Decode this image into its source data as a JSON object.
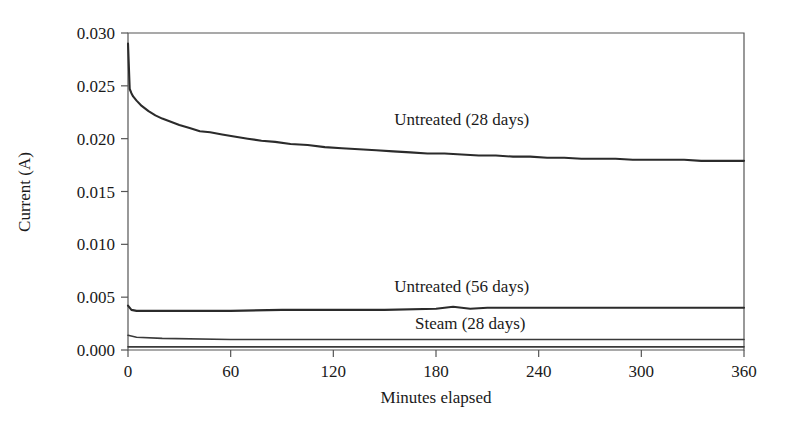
{
  "chart_data": {
    "type": "line",
    "title": "",
    "xlabel": "Minutes elapsed",
    "ylabel": "Current (A)",
    "xlim": [
      0,
      360
    ],
    "ylim": [
      0.0,
      0.03
    ],
    "xticks": [
      0,
      60,
      120,
      180,
      240,
      300,
      360
    ],
    "xtick_labels": [
      "0",
      "60",
      "120",
      "180",
      "240",
      "300",
      "360"
    ],
    "yticks": [
      0.0,
      0.005,
      0.01,
      0.015,
      0.02,
      0.025,
      0.03
    ],
    "ytick_labels": [
      "0.000",
      "0.005",
      "0.010",
      "0.015",
      "0.020",
      "0.025",
      "0.030"
    ],
    "grid": false,
    "legend": "inline-annotations",
    "series": [
      {
        "name": "Untreated (28 days)",
        "annotation": "Untreated (28 days)",
        "annotation_x": 195,
        "annotation_y": 0.0213,
        "color": "#2b2b2b",
        "x": [
          0,
          1,
          2,
          3,
          5,
          8,
          12,
          16,
          20,
          25,
          30,
          36,
          42,
          48,
          55,
          62,
          70,
          78,
          86,
          95,
          105,
          115,
          125,
          135,
          145,
          155,
          165,
          175,
          185,
          195,
          205,
          215,
          225,
          235,
          245,
          255,
          265,
          275,
          285,
          295,
          305,
          315,
          325,
          335,
          345,
          355,
          360
        ],
        "y": [
          0.029,
          0.0247,
          0.0243,
          0.024,
          0.0236,
          0.0231,
          0.0226,
          0.0222,
          0.0219,
          0.0216,
          0.0213,
          0.021,
          0.0207,
          0.0206,
          0.0204,
          0.0202,
          0.02,
          0.0198,
          0.0197,
          0.0195,
          0.0194,
          0.0192,
          0.0191,
          0.019,
          0.0189,
          0.0188,
          0.0187,
          0.0186,
          0.0186,
          0.0185,
          0.0184,
          0.0184,
          0.0183,
          0.0183,
          0.0182,
          0.0182,
          0.0181,
          0.0181,
          0.0181,
          0.018,
          0.018,
          0.018,
          0.018,
          0.0179,
          0.0179,
          0.0179,
          0.0179
        ]
      },
      {
        "name": "Untreated (56 days)",
        "annotation": "Untreated (56 days)",
        "annotation_x": 195,
        "annotation_y": 0.0055,
        "color": "#2b2b2b",
        "x": [
          0,
          2,
          5,
          10,
          20,
          40,
          60,
          90,
          120,
          150,
          180,
          190,
          200,
          210,
          220,
          240,
          270,
          300,
          330,
          360
        ],
        "y": [
          0.0042,
          0.0038,
          0.0037,
          0.0037,
          0.0037,
          0.0037,
          0.0037,
          0.0038,
          0.0038,
          0.0038,
          0.0039,
          0.0041,
          0.0039,
          0.004,
          0.004,
          0.004,
          0.004,
          0.004,
          0.004,
          0.004
        ]
      },
      {
        "name": "Steam (28 days)",
        "annotation": "Steam (28 days)",
        "annotation_x": 200,
        "annotation_y": 0.002,
        "color": "#3a3a3a",
        "x": [
          0,
          5,
          20,
          60,
          120,
          180,
          240,
          300,
          360
        ],
        "y": [
          0.0014,
          0.0012,
          0.0011,
          0.001,
          0.001,
          0.001,
          0.001,
          0.001,
          0.001
        ]
      },
      {
        "name": "baseline",
        "annotation": "",
        "color": "#5a5a5a",
        "x": [
          0,
          60,
          120,
          180,
          240,
          300,
          360
        ],
        "y": [
          0.0003,
          0.0003,
          0.0003,
          0.0003,
          0.0003,
          0.0003,
          0.0003
        ]
      }
    ]
  }
}
